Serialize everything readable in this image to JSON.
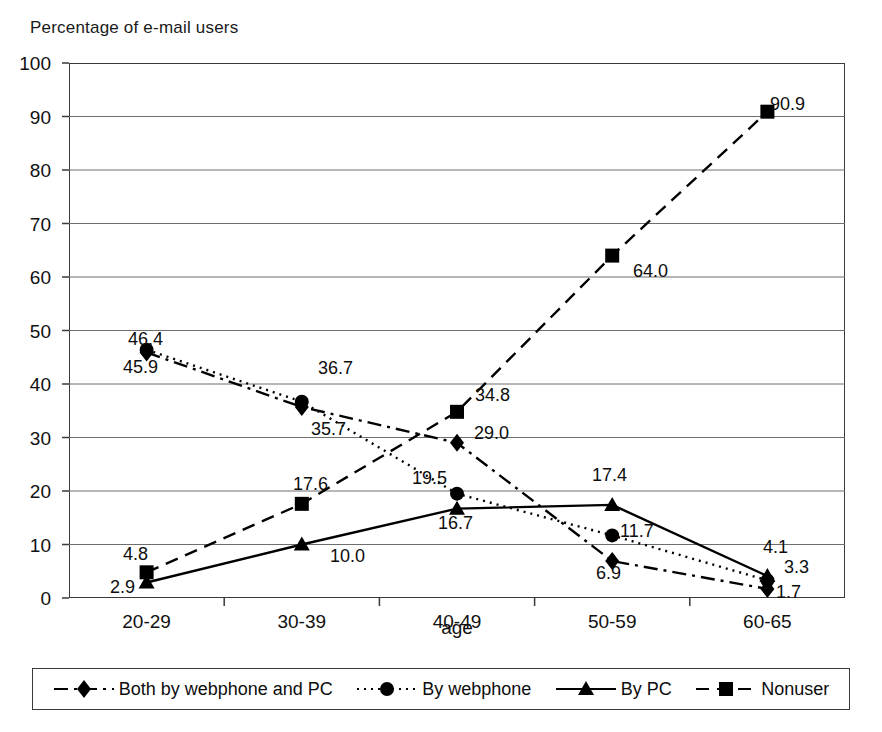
{
  "chart_data": {
    "type": "line",
    "title": "Percentage of e-mail users",
    "xlabel": "age",
    "ylabel": "",
    "categories": [
      "20-29",
      "30-39",
      "40-49",
      "50-59",
      "60-65"
    ],
    "ylim": [
      0,
      100
    ],
    "ytick_step": 10,
    "yticks": [
      "100",
      "90",
      "80",
      "70",
      "60",
      "50",
      "40",
      "30",
      "20",
      "10",
      "0"
    ],
    "grid": "horizontal",
    "legend_position": "bottom",
    "series": [
      {
        "name": "Both by webphone and PC",
        "marker": "diamond",
        "dash": "dash-dot",
        "color": "#000000",
        "values": [
          45.9,
          35.7,
          29.0,
          6.9,
          1.7
        ],
        "labels": [
          "45.9",
          "35.7",
          "29.0",
          "6.9",
          "1.7"
        ]
      },
      {
        "name": "By webphone",
        "marker": "circle",
        "dash": "dotted",
        "color": "#000000",
        "values": [
          46.4,
          36.7,
          19.5,
          11.7,
          3.3
        ],
        "labels": [
          "46.4",
          "36.7",
          "19.5",
          "11.7",
          "3.3"
        ]
      },
      {
        "name": "By PC",
        "marker": "triangle",
        "dash": "solid",
        "color": "#000000",
        "values": [
          2.9,
          10.0,
          16.7,
          17.4,
          4.1
        ],
        "labels": [
          "2.9",
          "10.0",
          "16.7",
          "17.4",
          "4.1"
        ]
      },
      {
        "name": "Nonuser",
        "marker": "square",
        "dash": "dashed",
        "color": "#000000",
        "values": [
          4.8,
          17.6,
          34.8,
          64.0,
          90.9
        ],
        "labels": [
          "4.8",
          "17.6",
          "34.8",
          "64.0",
          "90.9"
        ]
      }
    ]
  },
  "axis": {
    "yticks": [
      {
        "value": "100"
      },
      {
        "value": "90"
      },
      {
        "value": "80"
      },
      {
        "value": "70"
      },
      {
        "value": "60"
      },
      {
        "value": "50"
      },
      {
        "value": "40"
      },
      {
        "value": "30"
      },
      {
        "value": "20"
      },
      {
        "value": "10"
      },
      {
        "value": "0"
      }
    ],
    "xticks": [
      {
        "value": "20-29"
      },
      {
        "value": "30-39"
      },
      {
        "value": "40-49"
      },
      {
        "value": "50-59"
      },
      {
        "value": "60-65"
      }
    ],
    "xlabel": "age"
  },
  "title": "Percentage of e-mail users",
  "legend": {
    "items": [
      {
        "label": "Both by webphone and PC",
        "marker": "diamond-marker",
        "dash": "dash-dot"
      },
      {
        "label": "By webphone",
        "marker": "circle-marker",
        "dash": "dotted"
      },
      {
        "label": "By PC",
        "marker": "triangle-marker",
        "dash": "solid"
      },
      {
        "label": "Nonuser",
        "marker": "square-marker",
        "dash": "dashed"
      }
    ]
  },
  "point_labels": [
    {
      "text": "46.4",
      "x": 128,
      "y": 330
    },
    {
      "text": "45.9",
      "x": 123,
      "y": 358
    },
    {
      "text": "36.7",
      "x": 318,
      "y": 359
    },
    {
      "text": "35.7",
      "x": 311,
      "y": 420
    },
    {
      "text": "17.6",
      "x": 293,
      "y": 475
    },
    {
      "text": "4.8",
      "x": 123,
      "y": 545
    },
    {
      "text": "2.9",
      "x": 110,
      "y": 578
    },
    {
      "text": "10.0",
      "x": 330,
      "y": 547
    },
    {
      "text": "34.8",
      "x": 475,
      "y": 386
    },
    {
      "text": "29.0",
      "x": 474,
      "y": 424
    },
    {
      "text": "19.5",
      "x": 412,
      "y": 469
    },
    {
      "text": "16.7",
      "x": 438,
      "y": 514
    },
    {
      "text": "17.4",
      "x": 592,
      "y": 466
    },
    {
      "text": "11.7",
      "x": 620,
      "y": 522
    },
    {
      "text": "6.9",
      "x": 596,
      "y": 564
    },
    {
      "text": "64.0",
      "x": 633,
      "y": 262
    },
    {
      "text": "90.9",
      "x": 770,
      "y": 95
    },
    {
      "text": "4.1",
      "x": 763,
      "y": 538
    },
    {
      "text": "3.3",
      "x": 784,
      "y": 558
    },
    {
      "text": "1.7",
      "x": 776,
      "y": 583
    }
  ]
}
